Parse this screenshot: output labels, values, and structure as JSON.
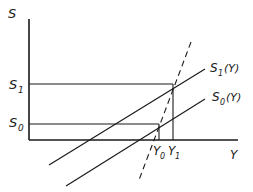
{
  "diagram": {
    "axes": {
      "y_label": "S",
      "x_label": "Y"
    },
    "levels": {
      "s1_label": "S",
      "s1_sub": "1",
      "s0_label": "S",
      "s0_sub": "0"
    },
    "curves": {
      "s1_curve_label": "S",
      "s1_curve_sub": "1",
      "s1_curve_arg": "(Y)",
      "s0_curve_label": "S",
      "s0_curve_sub": "0",
      "s0_curve_arg": "(Y)"
    },
    "incomes": {
      "y0_label": "Y",
      "y0_sub": "0",
      "y1_label": "Y",
      "y1_sub": "1"
    },
    "stroke_color": "#1a1a1a"
  }
}
